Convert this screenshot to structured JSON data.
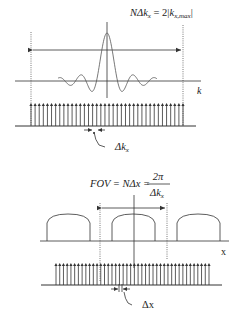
{
  "colors": {
    "ink": "#333333",
    "wave": "#555555",
    "background": "#ffffff"
  },
  "top_panel": {
    "title": "k-space sampling",
    "equation": {
      "lhs": "NΔk",
      "lhs_sub": "x",
      "equals": " = 2",
      "abs_open": "|",
      "rhs": "k",
      "rhs_sub": "x,max",
      "abs_close": "|"
    },
    "axis_label": "k",
    "spacing_label": {
      "main": "Δk",
      "sub": "x"
    },
    "impulse_count": 38,
    "comb_start_x": 31,
    "comb_end_x": 183
  },
  "bottom_panel": {
    "title": "image space replicas",
    "equation": {
      "lhs": "FOV = NΔx = ",
      "num": "2π",
      "den_main": "Δk",
      "den_sub": "x"
    },
    "axis_label": "x",
    "spacing_label": {
      "main": "Δx"
    },
    "replica_count": 3,
    "impulse_count": 42,
    "comb_start_x": 56,
    "comb_end_x": 209
  }
}
